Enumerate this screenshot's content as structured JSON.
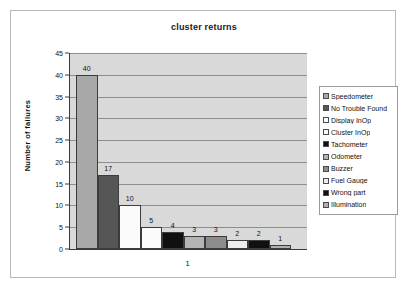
{
  "chart_data": {
    "type": "bar",
    "title": "cluster returns",
    "xlabel": "",
    "ylabel": "Number of failures",
    "categories": [
      "1"
    ],
    "x_tick_labels": [
      "1"
    ],
    "ylim": [
      0,
      45
    ],
    "y_tick_labels": [
      "0",
      "5",
      "10",
      "15",
      "20",
      "25",
      "30",
      "35",
      "40",
      "45"
    ],
    "y_tick_values": [
      0,
      5,
      10,
      15,
      20,
      25,
      30,
      35,
      40,
      45
    ],
    "grid": true,
    "legend_position": "right",
    "plot_background": "#d9d9d9",
    "series": [
      {
        "name": "Speedometer",
        "values": [
          40
        ],
        "label": "40",
        "color": "#a8a8a8"
      },
      {
        "name": "No Trouble Found",
        "values": [
          17
        ],
        "label": "17",
        "color": "#565656"
      },
      {
        "name": "Display InOp",
        "values": [
          10
        ],
        "label": "10",
        "color": "#fbfbfb"
      },
      {
        "name": "Cluster InOp",
        "values": [
          5
        ],
        "label": "5",
        "color": "#fbfbfb"
      },
      {
        "name": "Tachometer",
        "values": [
          4
        ],
        "label": "4",
        "color": "#101010"
      },
      {
        "name": "Odometer",
        "values": [
          3
        ],
        "label": "3",
        "color": "#b4b4b4"
      },
      {
        "name": "Buzzer",
        "values": [
          3
        ],
        "label": "3",
        "color": "#8c8c8c"
      },
      {
        "name": "Fuel Gauge",
        "values": [
          2
        ],
        "label": "2",
        "color": "#ededed"
      },
      {
        "name": "Wrong part",
        "values": [
          2
        ],
        "label": "2",
        "color": "#101010"
      },
      {
        "name": "Illumination",
        "values": [
          1
        ],
        "label": "1",
        "color": "#b0b0b0"
      }
    ]
  }
}
